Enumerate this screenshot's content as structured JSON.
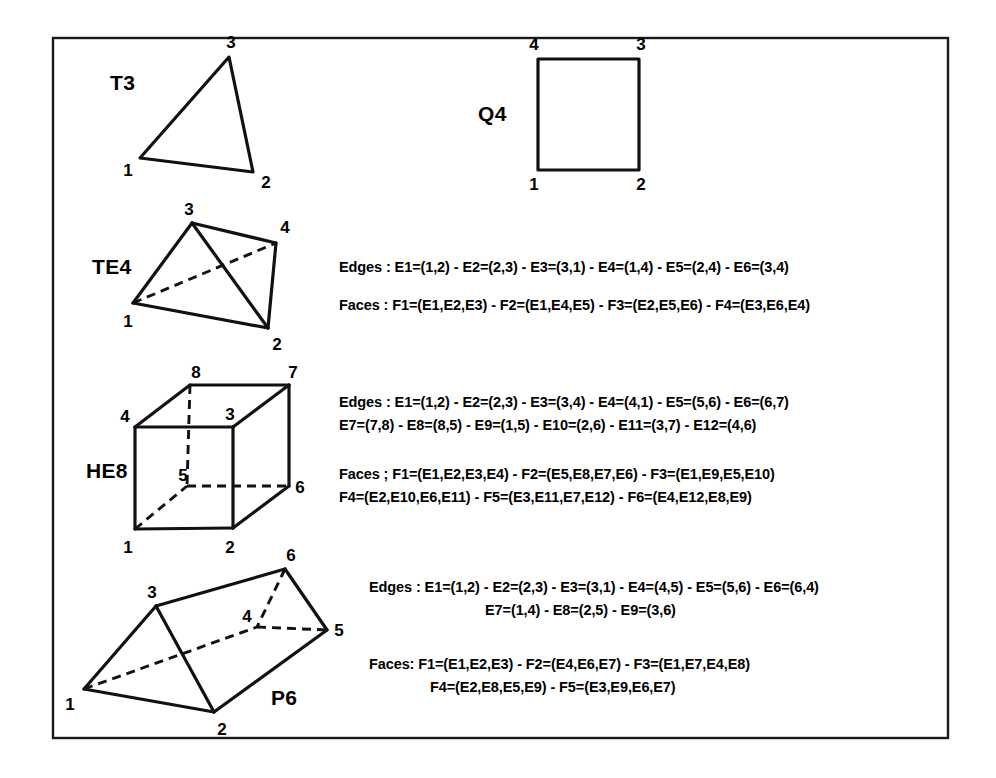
{
  "figure": {
    "background_color": "#ffffff",
    "line_color": "#111111",
    "border_color": "#1a1a1a"
  },
  "elements": [
    {
      "id": "T3",
      "label": "T3",
      "type": "triangle",
      "node_labels": [
        "1",
        "2",
        "3"
      ],
      "topology_lines": []
    },
    {
      "id": "Q4",
      "label": "Q4",
      "type": "quadrilateral",
      "node_labels": [
        "1",
        "2",
        "3",
        "4"
      ],
      "topology_lines": []
    },
    {
      "id": "TE4",
      "label": "TE4",
      "type": "tetrahedron",
      "node_labels": [
        "1",
        "2",
        "3",
        "4"
      ],
      "topology_lines": [
        "Edges : E1=(1,2) - E2=(2,3) - E3=(3,1) - E4=(1,4) - E5=(2,4) - E6=(3,4)",
        "Faces : F1=(E1,E2,E3) - F2=(E1,E4,E5) - F3=(E2,E5,E6) - F4=(E3,E6,E4)"
      ]
    },
    {
      "id": "HE8",
      "label": "HE8",
      "type": "hexahedron",
      "node_labels": [
        "1",
        "2",
        "3",
        "4",
        "5",
        "6",
        "7",
        "8"
      ],
      "topology_lines": [
        "Edges : E1=(1,2) - E2=(2,3) - E3=(3,4) - E4=(4,1) - E5=(5,6) - E6=(6,7)",
        "E7=(7,8) - E8=(8,5) - E9=(1,5) - E10=(2,6) - E11=(3,7) - E12=(4,6)",
        "Faces ; F1=(E1,E2,E3,E4) -  F2=(E5,E8,E7,E6) - F3=(E1,E9,E5,E10)",
        "F4=(E2,E10,E6,E11) - F5=(E3,E11,E7,E12) - F6=(E4,E12,E8,E9)"
      ]
    },
    {
      "id": "P6",
      "label": "P6",
      "type": "pentahedron-prism",
      "node_labels": [
        "1",
        "2",
        "3",
        "4",
        "5",
        "6"
      ],
      "topology_lines": [
        "Edges : E1=(1,2) -  E2=(2,3) - E3=(3,1) - E4=(4,5) - E5=(5,6) - E6=(6,4)",
        "E7=(1,4) - E8=(2,5) - E9=(3,6)",
        "Faces: F1=(E1,E2,E3) - F2=(E4,E6,E7) - F3=(E1,E7,E4,E8)",
        "F4=(E2,E8,E5,E9) - F5=(E3,E9,E6,E7)"
      ]
    }
  ],
  "labels": {
    "t3_nodes": {
      "n1": "1",
      "n2": "2",
      "n3": "3"
    },
    "q4_nodes": {
      "n1": "1",
      "n2": "2",
      "n3": "3",
      "n4": "4"
    },
    "te4_nodes": {
      "n1": "1",
      "n2": "2",
      "n3": "3",
      "n4": "4"
    },
    "he8_nodes": {
      "n1": "1",
      "n2": "2",
      "n3": "3",
      "n4": "4",
      "n5": "5",
      "n6": "6",
      "n7": "7",
      "n8": "8"
    },
    "p6_nodes": {
      "n1": "1",
      "n2": "2",
      "n3": "3",
      "n4": "4",
      "n5": "5",
      "n6": "6"
    }
  }
}
